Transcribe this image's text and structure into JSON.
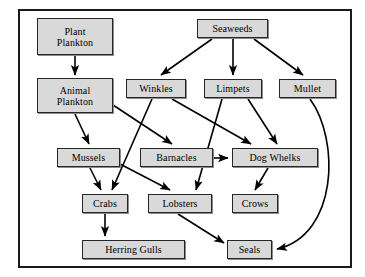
{
  "diagram": {
    "type": "food-web",
    "frame": {
      "visible": true,
      "border_color": "#1a1a1a"
    },
    "style": {
      "node_fill": "#d9d9d9",
      "node_border": "#262626",
      "edge_color": "#000000",
      "background": "#ffffff"
    },
    "nodes": [
      {
        "id": "plant_plankton",
        "label": "Plant\nPlankton",
        "x": 37,
        "y": 18,
        "w": 76,
        "h": 37
      },
      {
        "id": "seaweeds",
        "label": "Seaweeds",
        "x": 197,
        "y": 19,
        "w": 71,
        "h": 19
      },
      {
        "id": "animal_plankton",
        "label": "Animal\nPlankton",
        "x": 37,
        "y": 78,
        "w": 76,
        "h": 35
      },
      {
        "id": "winkles",
        "label": "Winkles",
        "x": 126,
        "y": 79,
        "w": 60,
        "h": 19
      },
      {
        "id": "limpets",
        "label": "Limpets",
        "x": 204,
        "y": 79,
        "w": 58,
        "h": 19
      },
      {
        "id": "mullet",
        "label": "Mullet",
        "x": 279,
        "y": 79,
        "w": 57,
        "h": 19
      },
      {
        "id": "mussels",
        "label": "Mussels",
        "x": 57,
        "y": 148,
        "w": 63,
        "h": 19
      },
      {
        "id": "barnacles",
        "label": "Barnacles",
        "x": 140,
        "y": 148,
        "w": 73,
        "h": 19
      },
      {
        "id": "dog_whelks",
        "label": "Dog Whelks",
        "x": 232,
        "y": 148,
        "w": 86,
        "h": 19
      },
      {
        "id": "crabs",
        "label": "Crabs",
        "x": 82,
        "y": 194,
        "w": 46,
        "h": 19
      },
      {
        "id": "lobsters",
        "label": "Lobsters",
        "x": 148,
        "y": 194,
        "w": 64,
        "h": 19
      },
      {
        "id": "crows",
        "label": "Crows",
        "x": 232,
        "y": 194,
        "w": 46,
        "h": 19
      },
      {
        "id": "herring_gulls",
        "label": "Herring Gulls",
        "x": 82,
        "y": 240,
        "w": 103,
        "h": 19
      },
      {
        "id": "seals",
        "label": "Seals",
        "x": 227,
        "y": 240,
        "w": 45,
        "h": 19
      }
    ],
    "edges": [
      {
        "from": "plant_plankton",
        "to": "animal_plankton",
        "path": "M 75,56 L 75,75",
        "shape": "straight"
      },
      {
        "from": "seaweeds",
        "to": "winkles",
        "path": "M 212,39 L 161,75",
        "shape": "straight"
      },
      {
        "from": "seaweeds",
        "to": "limpets",
        "path": "M 233,39 L 233,75",
        "shape": "straight"
      },
      {
        "from": "seaweeds",
        "to": "mullet",
        "path": "M 254,39 L 303,75",
        "shape": "straight"
      },
      {
        "from": "animal_plankton",
        "to": "mussels",
        "path": "M 75,114 L 89,144",
        "shape": "straight"
      },
      {
        "from": "animal_plankton",
        "to": "barnacles",
        "path": "M 113,105 L 172,144",
        "shape": "straight"
      },
      {
        "from": "winkles",
        "to": "crabs",
        "path": "M 152,99 L 112,190",
        "shape": "straight"
      },
      {
        "from": "winkles",
        "to": "dog_whelks",
        "path": "M 172,99 L 251,144",
        "shape": "straight"
      },
      {
        "from": "limpets",
        "to": "lobsters",
        "path": "M 222,99 L 196,190",
        "shape": "straight"
      },
      {
        "from": "limpets",
        "to": "dog_whelks",
        "path": "M 248,99 L 277,144",
        "shape": "straight"
      },
      {
        "from": "mullet",
        "to": "seals",
        "path": "M 310,99 C 340,140 338,235 277,249",
        "shape": "curved"
      },
      {
        "from": "mussels",
        "to": "crabs",
        "path": "M 90,168 L 101,190",
        "shape": "straight"
      },
      {
        "from": "mussels",
        "to": "lobsters",
        "path": "M 120,164 L 170,190",
        "shape": "straight"
      },
      {
        "from": "barnacles",
        "to": "dog_whelks",
        "path": "M 214,158 L 228,158",
        "shape": "straight"
      },
      {
        "from": "dog_whelks",
        "to": "crows",
        "path": "M 268,168 L 255,190",
        "shape": "straight"
      },
      {
        "from": "crabs",
        "to": "herring_gulls",
        "path": "M 105,214 L 105,236",
        "shape": "straight"
      },
      {
        "from": "lobsters",
        "to": "seals",
        "path": "M 178,214 L 224,243",
        "shape": "straight"
      }
    ]
  }
}
